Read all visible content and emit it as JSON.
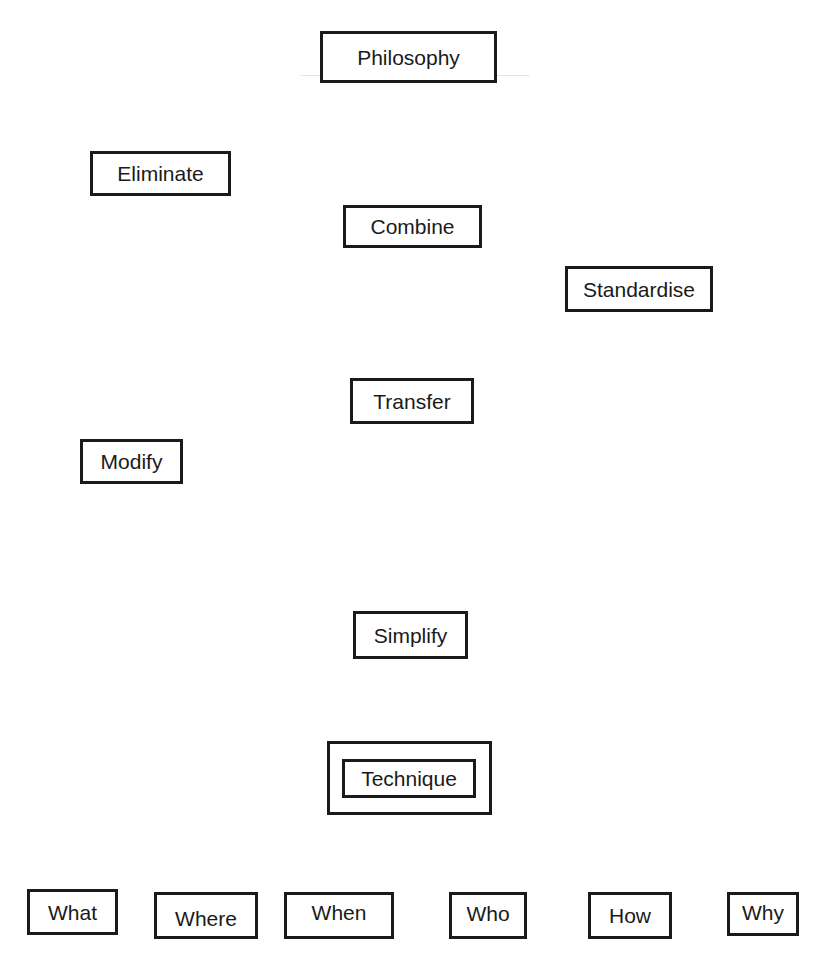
{
  "diagram": {
    "top": {
      "label": "Philosophy"
    },
    "approaches": [
      {
        "label": "Eliminate"
      },
      {
        "label": "Combine"
      },
      {
        "label": "Standardise"
      },
      {
        "label": "Transfer"
      },
      {
        "label": "Modify"
      },
      {
        "label": "Simplify"
      }
    ],
    "technique": {
      "label": "Technique"
    },
    "questions": [
      {
        "label": "What"
      },
      {
        "label": "Where"
      },
      {
        "label": "When"
      },
      {
        "label": "Who"
      },
      {
        "label": "How"
      },
      {
        "label": "Why"
      }
    ]
  }
}
